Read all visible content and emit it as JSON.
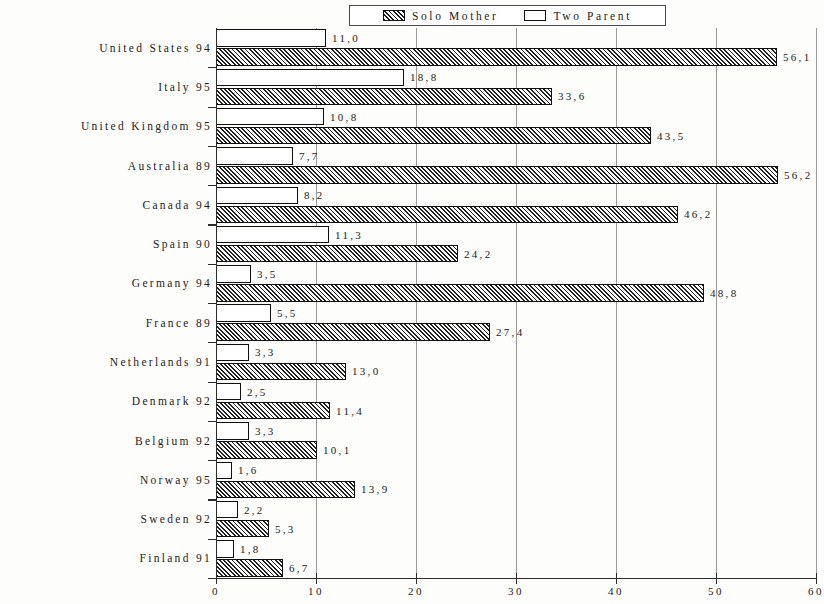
{
  "chart_data": {
    "type": "bar",
    "orientation": "horizontal",
    "title": "",
    "subtitle": "",
    "xlabel": "",
    "ylabel": "",
    "xlim": [
      0,
      60
    ],
    "xticks": [
      "0",
      "10",
      "20",
      "30",
      "40",
      "50",
      "60"
    ],
    "xtick_values": [
      0,
      10,
      20,
      30,
      40,
      50,
      60
    ],
    "grid": "vertical",
    "legend_position": "top-center",
    "categories": [
      "United States 94",
      "Italy 95",
      "United Kingdom 95",
      "Australia 89",
      "Canada 94",
      "Spain 90",
      "Germany 94",
      "France 89",
      "Netherlands 91",
      "Denmark 92",
      "Belgium 92",
      "Norway 95",
      "Sweden 92",
      "Finland 91"
    ],
    "series": [
      {
        "name": "Two Parent",
        "style": "open",
        "values": [
          11.0,
          18.8,
          10.8,
          7.7,
          8.2,
          11.3,
          3.5,
          5.5,
          3.3,
          2.5,
          3.3,
          1.6,
          2.2,
          1.8
        ],
        "labels": [
          "11,0",
          "18,8",
          "10,8",
          "7,7",
          "8,2",
          "11,3",
          "3,5",
          "5,5",
          "3,3",
          "2,5",
          "3,3",
          "1,6",
          "2,2",
          "1,8"
        ]
      },
      {
        "name": "Solo Mother",
        "style": "hatched",
        "values": [
          56.1,
          33.6,
          43.5,
          56.2,
          46.2,
          24.2,
          48.8,
          27.4,
          13.0,
          11.4,
          10.1,
          13.9,
          5.3,
          6.7
        ],
        "labels": [
          "56,1",
          "33,6",
          "43,5",
          "56,2",
          "46,2",
          "24,2",
          "48,8",
          "27,4",
          "13,0",
          "11,4",
          "10,1",
          "13,9",
          "5,3",
          "6,7"
        ]
      }
    ]
  },
  "legend": {
    "entries": [
      {
        "label": "Solo Mother",
        "swatch": "hatched"
      },
      {
        "label": "Two Parent",
        "swatch": "open"
      }
    ]
  }
}
